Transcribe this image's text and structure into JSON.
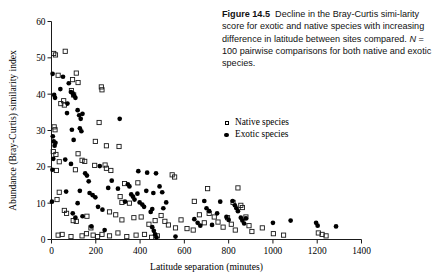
{
  "figure": {
    "number_label": "Figure 14.5",
    "caption_part1": "Decline in the Bray-Curtis simi-larity score for exotic and native species with increasing difference in latitude between sites compared. ",
    "caption_n_italic": "N",
    "caption_part2": " = 100 pairwise comparisons for both native and exotic species.",
    "caption_full": "Figure 14.5  Decline in the Bray-Curtis similarity score for exotic and native species with increasing difference in latitude between sites compared. N = 100 pairwise comparisons for both native and exotic species."
  },
  "legend": {
    "position": "upper-right",
    "items": [
      {
        "label": "Native species",
        "marker": "open-square",
        "color": "#000000"
      },
      {
        "label": "Exotic species",
        "marker": "filled-circle",
        "color": "#000000"
      }
    ]
  },
  "chart_data": {
    "type": "scatter",
    "title": "",
    "xlabel": "Latitude separation (minutes)",
    "ylabel": "Abundance (Bray-Curtis) similarity index",
    "xlim": [
      0,
      1400
    ],
    "ylim": [
      0,
      60
    ],
    "xticks": [
      0,
      200,
      400,
      600,
      800,
      1000,
      1200,
      1400
    ],
    "yticks": [
      0,
      10,
      20,
      30,
      40,
      50,
      60
    ],
    "grid": false,
    "n_per_series": 100,
    "series": [
      {
        "name": "Native species",
        "marker": "open-square",
        "points": [
          [
            10,
            51.2
          ],
          [
            18,
            50.8
          ],
          [
            62,
            51.8
          ],
          [
            30,
            45.2
          ],
          [
            95,
            44.0
          ],
          [
            112,
            45.8
          ],
          [
            120,
            43.2
          ],
          [
            55,
            38.2
          ],
          [
            58,
            37.0
          ],
          [
            90,
            41.0
          ],
          [
            100,
            39.8
          ],
          [
            42,
            37.4
          ],
          [
            225,
            42.0
          ],
          [
            228,
            41.2
          ],
          [
            12,
            31.0
          ],
          [
            16,
            30.2
          ],
          [
            8,
            24.2
          ],
          [
            20,
            23.4
          ],
          [
            215,
            32.2
          ],
          [
            198,
            27.0
          ],
          [
            248,
            25.8
          ],
          [
            305,
            25.6
          ],
          [
            35,
            21.4
          ],
          [
            120,
            23.6
          ],
          [
            138,
            21.8
          ],
          [
            22,
            19.0
          ],
          [
            108,
            19.2
          ],
          [
            150,
            21.5
          ],
          [
            195,
            20.4
          ],
          [
            242,
            20.5
          ],
          [
            248,
            19.6
          ],
          [
            268,
            19.0
          ],
          [
            545,
            17.8
          ],
          [
            556,
            17.2
          ],
          [
            330,
            15.4
          ],
          [
            390,
            15.6
          ],
          [
            705,
            14.0
          ],
          [
            842,
            14.2
          ],
          [
            35,
            13.0
          ],
          [
            25,
            11.0
          ],
          [
            310,
            11.8
          ],
          [
            318,
            10.2
          ],
          [
            352,
            10.0
          ],
          [
            645,
            10.5
          ],
          [
            820,
            10.2
          ],
          [
            855,
            9.4
          ],
          [
            862,
            8.8
          ],
          [
            58,
            8.0
          ],
          [
            68,
            7.2
          ],
          [
            98,
            5.2
          ],
          [
            112,
            5.0
          ],
          [
            160,
            6.4
          ],
          [
            178,
            3.2
          ],
          [
            262,
            7.6
          ],
          [
            290,
            6.8
          ],
          [
            318,
            5.4
          ],
          [
            372,
            6.0
          ],
          [
            405,
            6.2
          ],
          [
            440,
            4.2
          ],
          [
            468,
            5.2
          ],
          [
            495,
            6.6
          ],
          [
            512,
            5.0
          ],
          [
            528,
            4.0
          ],
          [
            560,
            3.2
          ],
          [
            585,
            5.4
          ],
          [
            612,
            3.0
          ],
          [
            640,
            2.6
          ],
          [
            668,
            6.8
          ],
          [
            690,
            4.6
          ],
          [
            712,
            7.2
          ],
          [
            735,
            6.2
          ],
          [
            752,
            4.8
          ],
          [
            775,
            3.4
          ],
          [
            795,
            6.0
          ],
          [
            812,
            4.2
          ],
          [
            830,
            2.6
          ],
          [
            878,
            6.2
          ],
          [
            892,
            3.8
          ],
          [
            905,
            2.2
          ],
          [
            952,
            3.2
          ],
          [
            1002,
            1.6
          ],
          [
            1048,
            1.2
          ],
          [
            1205,
            1.8
          ],
          [
            1222,
            1.4
          ],
          [
            1240,
            1.0
          ],
          [
            30,
            1.2
          ],
          [
            48,
            1.4
          ],
          [
            88,
            0.8
          ],
          [
            138,
            1.0
          ],
          [
            158,
            1.6
          ],
          [
            188,
            1.2
          ],
          [
            208,
            0.8
          ],
          [
            228,
            1.4
          ],
          [
            262,
            1.0
          ],
          [
            300,
            1.8
          ],
          [
            340,
            0.8
          ],
          [
            382,
            1.2
          ],
          [
            420,
            1.4
          ],
          [
            452,
            0.6
          ],
          [
            478,
            1.0
          ]
        ]
      },
      {
        "name": "Exotic species",
        "marker": "filled-circle",
        "points": [
          [
            5,
            45.6
          ],
          [
            52,
            44.8
          ],
          [
            78,
            43.0
          ],
          [
            40,
            41.4
          ],
          [
            88,
            40.6
          ],
          [
            96,
            40.2
          ],
          [
            102,
            39.6
          ],
          [
            108,
            39.0
          ],
          [
            12,
            39.8
          ],
          [
            16,
            39.0
          ],
          [
            72,
            37.4
          ],
          [
            70,
            34.8
          ],
          [
            118,
            35.6
          ],
          [
            125,
            34.2
          ],
          [
            132,
            33.2
          ],
          [
            140,
            34.6
          ],
          [
            308,
            33.2
          ],
          [
            6,
            28.4
          ],
          [
            10,
            27.0
          ],
          [
            14,
            25.8
          ],
          [
            18,
            26.6
          ],
          [
            92,
            30.2
          ],
          [
            128,
            30.6
          ],
          [
            135,
            29.8
          ],
          [
            100,
            27.4
          ],
          [
            8,
            22.2
          ],
          [
            62,
            22.0
          ],
          [
            88,
            20.8
          ],
          [
            4,
            19.2
          ],
          [
            152,
            18.2
          ],
          [
            160,
            17.6
          ],
          [
            168,
            16.0
          ],
          [
            392,
            18.8
          ],
          [
            432,
            18.4
          ],
          [
            472,
            18.2
          ],
          [
            218,
            20.2
          ],
          [
            272,
            16.2
          ],
          [
            256,
            14.2
          ],
          [
            300,
            14.0
          ],
          [
            345,
            15.2
          ],
          [
            352,
            14.6
          ],
          [
            66,
            13.2
          ],
          [
            128,
            13.4
          ],
          [
            172,
            12.8
          ],
          [
            186,
            12.2
          ],
          [
            198,
            11.6
          ],
          [
            360,
            12.4
          ],
          [
            368,
            11.8
          ],
          [
            375,
            11.0
          ],
          [
            388,
            12.6
          ],
          [
            428,
            13.4
          ],
          [
            460,
            12.8
          ],
          [
            488,
            14.6
          ],
          [
            500,
            13.0
          ],
          [
            2,
            10.4
          ],
          [
            118,
            10.0
          ],
          [
            210,
            9.0
          ],
          [
            230,
            8.2
          ],
          [
            332,
            10.4
          ],
          [
            398,
            10.2
          ],
          [
            410,
            9.6
          ],
          [
            418,
            9.0
          ],
          [
            455,
            8.4
          ],
          [
            448,
            7.6
          ],
          [
            505,
            8.6
          ],
          [
            518,
            10.2
          ],
          [
            690,
            10.6
          ],
          [
            762,
            10.4
          ],
          [
            818,
            10.6
          ],
          [
            828,
            9.4
          ],
          [
            835,
            8.6
          ],
          [
            842,
            7.8
          ],
          [
            700,
            8.6
          ],
          [
            712,
            7.8
          ],
          [
            748,
            7.2
          ],
          [
            790,
            6.2
          ],
          [
            800,
            5.4
          ],
          [
            855,
            6.0
          ],
          [
            862,
            5.2
          ],
          [
            870,
            4.4
          ],
          [
            878,
            5.8
          ],
          [
            645,
            5.6
          ],
          [
            660,
            4.6
          ],
          [
            672,
            3.8
          ],
          [
            725,
            4.0
          ],
          [
            1000,
            4.6
          ],
          [
            1080,
            5.2
          ],
          [
            1195,
            4.6
          ],
          [
            1202,
            3.8
          ],
          [
            1285,
            3.6
          ],
          [
            96,
            7.2
          ],
          [
            108,
            6.0
          ],
          [
            140,
            6.4
          ],
          [
            180,
            3.6
          ],
          [
            240,
            2.6
          ],
          [
            455,
            3.4
          ],
          [
            462,
            2.4
          ],
          [
            468,
            1.4
          ],
          [
            474,
            0.6
          ],
          [
            560,
            0.8
          ]
        ]
      }
    ]
  }
}
